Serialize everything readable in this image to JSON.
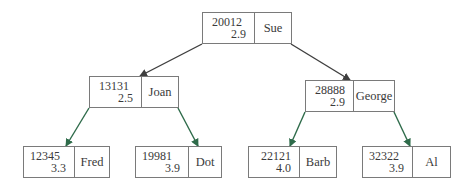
{
  "diagram": {
    "type": "binary-search-tree",
    "edge_colors": {
      "root_edges": "#3f3f3f",
      "leaf_edges": "#2e6b4a"
    },
    "nodes": {
      "root": {
        "id": "20012",
        "gpa": "2.9",
        "name": "Sue"
      },
      "left": {
        "id": "13131",
        "gpa": "2.5",
        "name": "Joan"
      },
      "right": {
        "id": "28888",
        "gpa": "2.9",
        "name": "George"
      },
      "ll": {
        "id": "12345",
        "gpa": "3.3",
        "name": "Fred"
      },
      "lr": {
        "id": "19981",
        "gpa": "3.9",
        "name": "Dot"
      },
      "rl": {
        "id": "22121",
        "gpa": "4.0",
        "name": "Barb"
      },
      "rr": {
        "id": "32322",
        "gpa": "3.9",
        "name": "Al"
      }
    },
    "edges": [
      {
        "from": "Sue",
        "to": "Joan"
      },
      {
        "from": "Sue",
        "to": "George"
      },
      {
        "from": "Joan",
        "to": "Fred"
      },
      {
        "from": "Joan",
        "to": "Dot"
      },
      {
        "from": "George",
        "to": "Barb"
      },
      {
        "from": "George",
        "to": "Al"
      }
    ]
  }
}
